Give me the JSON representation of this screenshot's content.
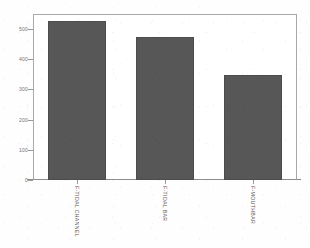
{
  "chart_data": {
    "type": "bar",
    "title": "",
    "subtitle": "",
    "xlabel": "",
    "ylabel": "",
    "categories": [
      "F-TIDAL CHANNEL",
      "F-TIDAL BAR",
      "F-MOUTHBAR"
    ],
    "values": [
      527,
      473,
      348
    ],
    "ylim": [
      0,
      560
    ],
    "yticks": [
      0,
      100,
      200,
      300,
      400,
      500
    ],
    "ytick_labels": [
      "0",
      "100",
      "200",
      "300",
      "400",
      "500"
    ],
    "grid": false,
    "legend": null,
    "legend_position": "none",
    "bar_color": "#575757",
    "frame_color": "#a8a8a8",
    "background_color": "#ffffff",
    "annotations": []
  },
  "axes": {
    "y_axis_name": "y-axis",
    "x_axis_name": "x-axis"
  }
}
